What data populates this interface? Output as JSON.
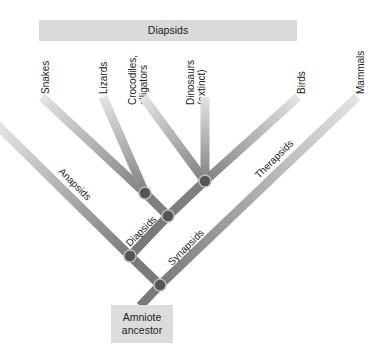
{
  "diagram": {
    "type": "cladogram",
    "banner": {
      "label": "Diapsids"
    },
    "tips": [
      {
        "id": "snakes",
        "lines": [
          "Snakes"
        ]
      },
      {
        "id": "lizards",
        "lines": [
          "Lizards"
        ]
      },
      {
        "id": "crocodiles",
        "lines": [
          "Crocodiles,",
          "alligators"
        ]
      },
      {
        "id": "dinosaurs",
        "lines": [
          "Dinosaurs",
          "(extinct)"
        ]
      },
      {
        "id": "birds",
        "lines": [
          "Birds"
        ]
      },
      {
        "id": "mammals",
        "lines": [
          "Mammals"
        ]
      }
    ],
    "branch_labels": {
      "anapsids": "Anapsids",
      "diapsids": "Diapsids",
      "synapsids": "Synapsids",
      "therapsids": "Therapsids"
    },
    "root": {
      "line1": "Amniote",
      "line2": "ancestor"
    },
    "colors": {
      "branch_dark": "#7a7a7a",
      "branch_light": "#e0e0e0",
      "node": "#555555",
      "node_ring": "#bdbdbd",
      "box": "#d9d9d9"
    }
  }
}
